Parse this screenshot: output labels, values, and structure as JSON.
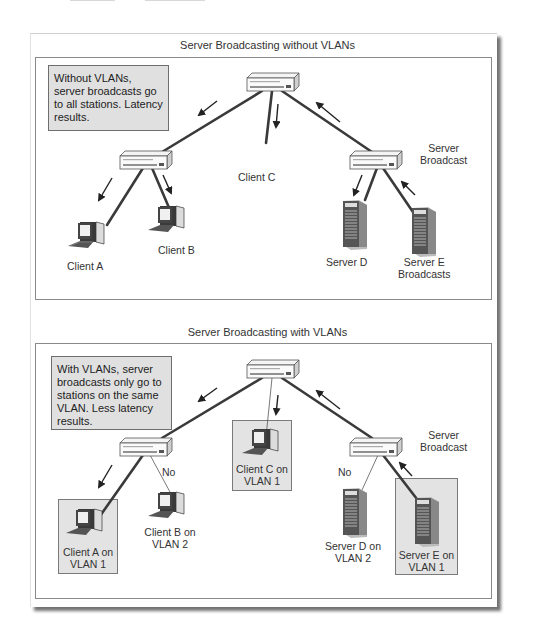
{
  "colors": {
    "background": "#ffffff",
    "note_fill": "#e0e0e0",
    "highlight_fill": "#e3e3e3",
    "wire": "#3a3a3a",
    "border": "#8a8a8a",
    "text": "#333333"
  },
  "top_panel": {
    "title": "Server Broadcasting without VLANs",
    "note": "Without VLANs, server broadcasts go to all stations. Latency results.",
    "labels": {
      "client_a": "Client A",
      "client_b": "Client B",
      "client_c": "Client C",
      "server_d": "Server D",
      "server_e_line1": "Server E",
      "server_e_line2": "Broadcasts",
      "server_broadcast_line1": "Server",
      "server_broadcast_line2": "Broadcast"
    },
    "icons": {
      "switches": [
        "switch-icon",
        "switch-icon",
        "switch-icon"
      ],
      "clients": [
        "desktop-computer-icon",
        "desktop-computer-icon"
      ],
      "servers": [
        "tower-server-icon",
        "tower-server-icon"
      ],
      "arrows": [
        "arrow-icon"
      ]
    }
  },
  "bottom_panel": {
    "title": "Server Broadcasting with VLANs",
    "note": "With VLANs, server broadcasts only go to stations on the same VLAN. Less latency results.",
    "labels": {
      "client_a_line1": "Client A on",
      "client_a_line2": "VLAN 1",
      "client_b_line1": "Client B on",
      "client_b_line2": "VLAN 2",
      "client_c_line1": "Client C on",
      "client_c_line2": "VLAN 1",
      "server_d_line1": "Server D on",
      "server_d_line2": "VLAN 2",
      "server_e_line1": "Server E on",
      "server_e_line2": "VLAN 1",
      "no_left": "No",
      "no_right": "No",
      "server_broadcast_line1": "Server",
      "server_broadcast_line2": "Broadcast"
    }
  }
}
